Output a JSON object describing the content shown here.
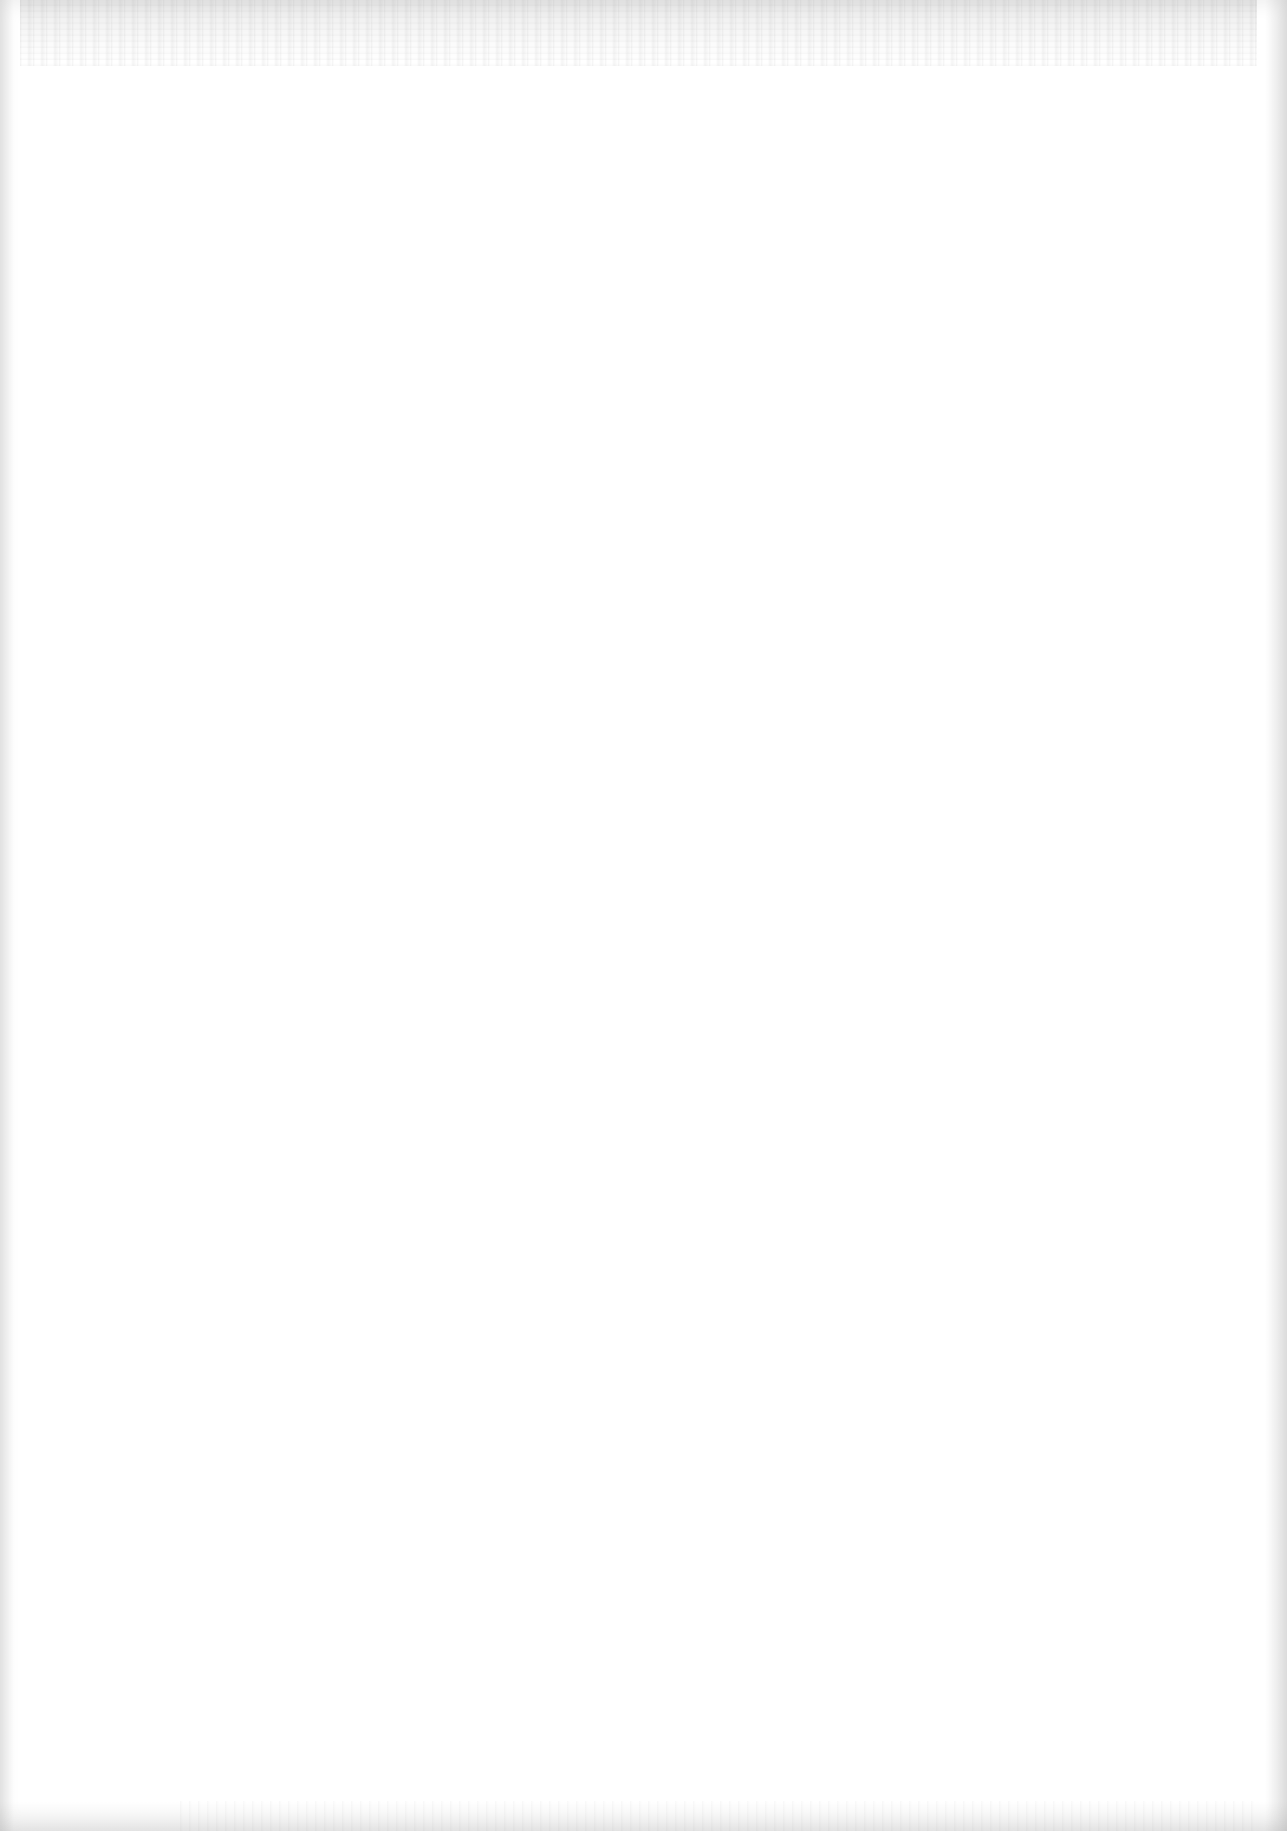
{
  "document": {
    "type": "blank-scanned-page",
    "text_blocks": []
  }
}
